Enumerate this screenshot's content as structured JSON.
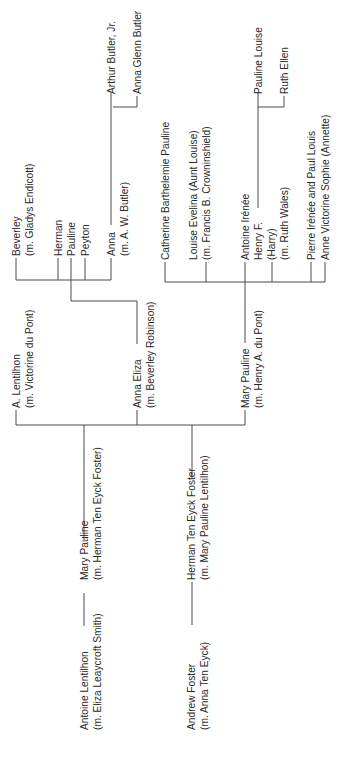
{
  "ancestors": {
    "lentilhon_father": {
      "name": "Antoine Lentilhon",
      "spouse": "(m. Eliza Leaycroft Smith)"
    },
    "lentilhon_daughter": {
      "name": "Mary Pauline",
      "spouse": "(m. Herman Ten Eyck Foster)"
    },
    "foster_father": {
      "name": "Andrew Foster",
      "spouse": "(m. Anna Ten Eyck)"
    },
    "foster_son": {
      "name": "Herman Ten Eyck Foster",
      "spouse": "(m. Mary Pauline Lentilhon)"
    }
  },
  "children": [
    {
      "name": "A. Lentilhon",
      "spouse": "(m. Victorine du Pont)"
    },
    {
      "name": "Anna Eliza",
      "spouse": "(m. Beverley Robinson)"
    },
    {
      "name": "Mary Pauline",
      "spouse": "(m. Henry A. du Pont)"
    }
  ],
  "robinson_children": [
    {
      "name": "Beverley",
      "spouse": "(m. Gladys Endicott)"
    },
    {
      "name": "Herman"
    },
    {
      "name": "Pauline"
    },
    {
      "name": "Peyton"
    },
    {
      "name": "Anna",
      "spouse": "(m. A. W. Butler)"
    }
  ],
  "butler_children": [
    {
      "name": "Arthur Butler, Jr."
    },
    {
      "name": "Anna Glenn Butler"
    }
  ],
  "dupont_children": [
    {
      "name": "Catherine Barthelemie Pauline"
    },
    {
      "name": "Louise Evelina (Aunt Louise)",
      "spouse": "(m. Francis B. Crowninshield)"
    },
    {
      "name": "Antoine Irénée"
    },
    {
      "name": "Henry F.",
      "nickname": "(Harry)",
      "spouse": "(m. Ruth Wales)"
    },
    {
      "name": "Pierre Irénée and Paul Louis"
    },
    {
      "name": "Anne Victorine Sophie (Annette)"
    }
  ],
  "henry_children": [
    {
      "name": "Pauline Louise"
    },
    {
      "name": "Ruth Ellen"
    }
  ],
  "colors": {
    "line": "#4a4a4a",
    "text": "#2a2a2a",
    "background": "#ffffff"
  }
}
